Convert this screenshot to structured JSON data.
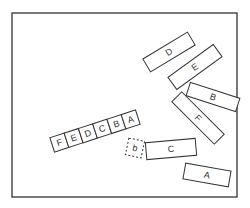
{
  "diagram": {
    "frame": {
      "x": 12,
      "y": 13,
      "w": 225,
      "h": 184,
      "stroke": "#333333"
    },
    "blocks": [
      {
        "id": "D",
        "label": "D",
        "cx": 169,
        "cy": 52,
        "w": 52,
        "h": 15,
        "angle": -31
      },
      {
        "id": "E",
        "label": "E",
        "cx": 195,
        "cy": 67,
        "w": 56,
        "h": 15,
        "angle": -36
      },
      {
        "id": "B",
        "label": "B",
        "cx": 213,
        "cy": 97,
        "w": 52,
        "h": 14,
        "angle": 18
      },
      {
        "id": "F",
        "label": "F",
        "cx": 198,
        "cy": 118,
        "w": 60,
        "h": 14,
        "angle": 45
      },
      {
        "id": "C",
        "label": "C",
        "cx": 171,
        "cy": 149,
        "w": 50,
        "h": 17,
        "angle": -5
      },
      {
        "id": "A",
        "label": "A",
        "cx": 207,
        "cy": 175,
        "w": 46,
        "h": 16,
        "angle": 10
      }
    ],
    "dashed_block": {
      "id": "b",
      "label": "b",
      "cx": 135,
      "cy": 148,
      "w": 16,
      "h": 17,
      "angle": 12
    },
    "strip": {
      "cx": 95,
      "cy": 131,
      "cell_w": 15,
      "h": 15,
      "angle": -18,
      "cells": [
        "F",
        "E",
        "D",
        "C",
        "B",
        "A"
      ]
    }
  }
}
